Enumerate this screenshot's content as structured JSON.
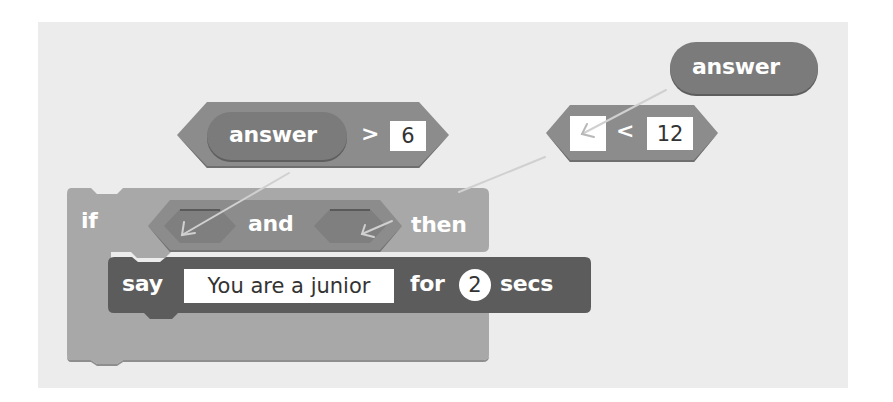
{
  "palette": {
    "background": "#ffffff",
    "canvas": "#ececec",
    "operator_block": "#8c8c8c",
    "reporter_block": "#7b7b7b",
    "control_block": "#a8a8a8",
    "looks_block": "#5c5c5c",
    "input_fill": "#ffffff",
    "arrow": "#c8c8c8"
  },
  "blocks": {
    "answer_reporter_standalone": {
      "label": "answer"
    },
    "greater_than": {
      "left": {
        "label": "answer"
      },
      "operator": ">",
      "right": "6"
    },
    "less_than": {
      "left": "",
      "operator": "<",
      "right": "12"
    },
    "if_block": {
      "keyword_if": "if",
      "condition": {
        "operator": "and",
        "left_slot": "",
        "right_slot": ""
      },
      "keyword_then": "then",
      "body": {
        "say": {
          "keyword_say": "say",
          "message": "You are a junior",
          "keyword_for": "for",
          "seconds": "2",
          "keyword_secs": "secs"
        }
      }
    }
  },
  "arrows": [
    {
      "from": "greater_than",
      "to": "and.left_slot"
    },
    {
      "from": "answer_reporter_standalone",
      "to": "less_than.left"
    },
    {
      "from": "less_than",
      "to": "and.right_slot"
    }
  ]
}
